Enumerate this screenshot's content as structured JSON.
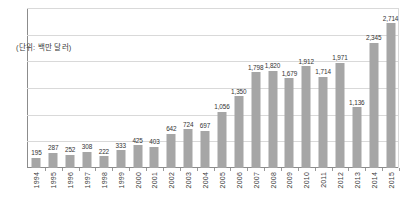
{
  "chart_data": {
    "type": "bar",
    "title": "",
    "subtitle": "",
    "unit_label": "(단위: 백만 달러)",
    "xlabel": "",
    "ylabel": "",
    "ylim": [
      0,
      3000
    ],
    "grid": true,
    "gridlines": [
      0,
      500,
      1000,
      1500,
      2000,
      2500,
      3000
    ],
    "legend": "none",
    "bar_color": "#a6a6a6",
    "categories": [
      "1994",
      "1995",
      "1996",
      "1997",
      "1998",
      "1999",
      "2000",
      "2001",
      "2002",
      "2003",
      "2004",
      "2005",
      "2006",
      "2007",
      "2008",
      "2009",
      "2010",
      "2011",
      "2012",
      "2013",
      "2014",
      "2015"
    ],
    "values": [
      195,
      287,
      252,
      308,
      222,
      333,
      425,
      403,
      642,
      724,
      697,
      1056,
      1350,
      1798,
      1820,
      1679,
      1912,
      1714,
      1971,
      1136,
      2345,
      2714
    ],
    "value_labels": [
      "195",
      "287",
      "252",
      "308",
      "222",
      "333",
      "425",
      "403",
      "642",
      "724",
      "697",
      "1,056",
      "1,350",
      "1,798",
      "1,820",
      "1,679",
      "1,912",
      "1,714",
      "1,971",
      "1,136",
      "2,345",
      "2,714"
    ]
  },
  "colors": {
    "bar": "#a6a6a6",
    "grid": "#d9d9d9",
    "axis": "#8c8c8c",
    "text": "#333333"
  }
}
